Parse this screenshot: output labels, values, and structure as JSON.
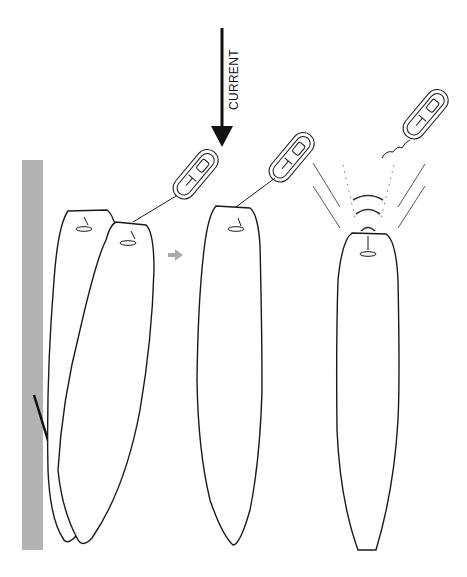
{
  "diagram": {
    "current_label": "CURRENT",
    "panels": [
      {
        "name": "panel-drift",
        "description": "Boat drifting against dock, remote held near bow"
      },
      {
        "name": "panel-straightened",
        "description": "Boat straightened away from dock"
      },
      {
        "name": "panel-signal",
        "description": "Remote transmitting signal to bow receiver"
      }
    ],
    "icons": [
      "current-arrow-icon",
      "remote-control-icon",
      "transition-arrow-icon",
      "signal-waves-icon",
      "dock"
    ],
    "colors": {
      "dock": "#b3b3b3",
      "stroke": "#1a1a1a",
      "transition_arrow": "#aaaaaa"
    }
  }
}
